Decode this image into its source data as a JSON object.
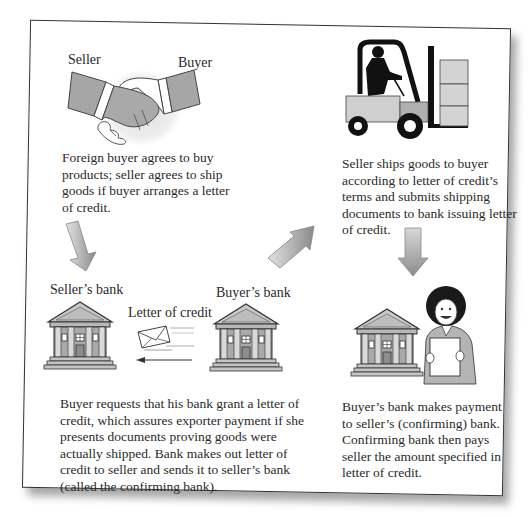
{
  "diagram": {
    "colors": {
      "frame_border": "#333333",
      "figure_gray": "#a8a8a8",
      "figure_light": "#d4d4d4",
      "arrow_gradient_light": "#e0e0e0",
      "arrow_gradient_dark": "#8a8a8a",
      "text": "#2a2a2a"
    },
    "steps": [
      {
        "id": "agreement",
        "icon": "handshake-icon",
        "labels": {
          "left": "Seller",
          "right": "Buyer"
        },
        "text_lines": [
          "Foreign buyer agrees to buy",
          "products; seller agrees to ship",
          "goods if buyer arranges a letter",
          "of credit."
        ]
      },
      {
        "id": "issue-letter",
        "icons": [
          "bank-icon",
          "envelope-icon",
          "bank-icon"
        ],
        "labels": {
          "sellers_bank": "Seller’s bank",
          "buyers_bank": "Buyer’s bank",
          "letter": "Letter of credit"
        },
        "text_lines": [
          "Buyer requests that his bank grant a letter of",
          "credit, which assures exporter payment if she",
          "presents documents proving goods were",
          "actually shipped. Bank makes out letter of",
          "credit to seller and sends it to seller’s bank",
          "(called the confirming bank)."
        ]
      },
      {
        "id": "shipping",
        "icon": "forklift-icon",
        "text_lines": [
          "Seller ships goods to buyer",
          "according to letter of credit’s",
          "terms and submits shipping",
          "documents to bank issuing letter",
          "of credit."
        ]
      },
      {
        "id": "payment",
        "icons": [
          "bank-icon",
          "person-holding-document-icon"
        ],
        "text_lines": [
          "Buyer’s bank makes payment",
          "to seller’s (confirming) bank.",
          "Confirming bank then pays",
          "seller the amount specified in",
          "letter of credit."
        ]
      }
    ],
    "arrows": [
      {
        "name": "arrow-down-left",
        "direction": "down"
      },
      {
        "name": "arrow-up-right",
        "direction": "up-right"
      },
      {
        "name": "arrow-down-right",
        "direction": "down"
      }
    ]
  }
}
